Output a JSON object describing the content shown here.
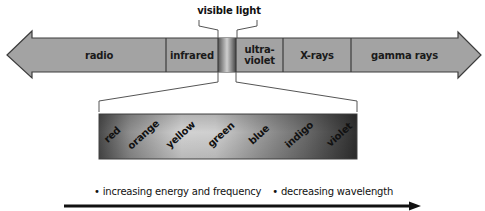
{
  "diagram": {
    "visible_light_label": "visible light",
    "bands": [
      {
        "label": "radio",
        "x": 32,
        "w": 134
      },
      {
        "label": "infrared",
        "x": 166,
        "w": 52
      },
      {
        "label": "",
        "x": 218,
        "w": 18
      },
      {
        "label": "ultra-\nviolet",
        "x": 236,
        "w": 47
      },
      {
        "label": "X-rays",
        "x": 283,
        "w": 68
      },
      {
        "label": "gamma rays",
        "x": 351,
        "w": 107
      }
    ],
    "band_labels": {
      "radio": "radio",
      "infrared": "infrared",
      "ultraviolet_line1": "ultra-",
      "ultraviolet_line2": "violet",
      "xrays": "X-rays",
      "gamma": "gamma rays"
    },
    "visible_colors": [
      "red",
      "orange",
      "yellow",
      "green",
      "blue",
      "indigo",
      "violet"
    ],
    "captions": {
      "energy": "• increasing energy and frequency",
      "wavelength": "• decreasing wavelength"
    },
    "colors": {
      "band_fill": "#a3a3a3",
      "band_border": "#3c3c3c",
      "spectrum_dark": "#3a3a3a",
      "spectrum_light": "#d8d8d8",
      "arrow": "#111111"
    }
  }
}
